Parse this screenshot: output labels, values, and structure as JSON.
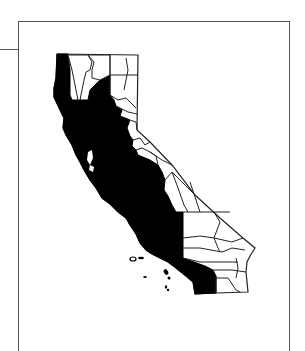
{
  "figure": {
    "highlight_color": "#000000",
    "county_line_color": "#222222",
    "background_color": "#ffffff",
    "frame_color": "#555555",
    "legend": {
      "shaded_region": "highlighted counties (coastal and Central Valley counties through Los Angeles/Orange)",
      "unshaded_region": "other counties"
    }
  }
}
